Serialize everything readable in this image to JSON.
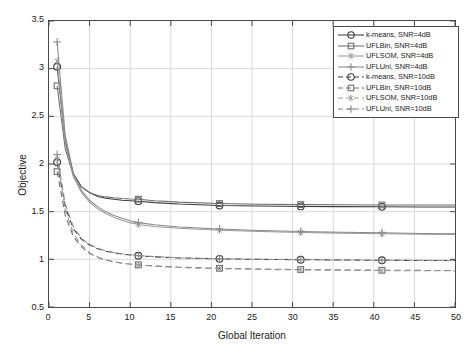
{
  "chart_data": {
    "type": "line",
    "title": "",
    "xlabel": "Global Iteration",
    "ylabel": "Objective",
    "xlim": [
      0,
      50
    ],
    "ylim": [
      0.5,
      3.5
    ],
    "xticks": [
      0,
      5,
      10,
      15,
      20,
      25,
      30,
      35,
      40,
      45,
      50
    ],
    "yticks": [
      0.5,
      1,
      1.5,
      2,
      2.5,
      3,
      3.5
    ],
    "grid": true,
    "legend_position": "top-right",
    "marker_x": [
      1,
      11,
      21,
      31,
      41
    ],
    "x": [
      1,
      2,
      3,
      4,
      5,
      6,
      7,
      8,
      9,
      10,
      11,
      13,
      16,
      21,
      26,
      31,
      36,
      41,
      46,
      50
    ],
    "series": [
      {
        "name": "k-means, SNR=4dB",
        "marker": "circle",
        "linestyle": "solid",
        "color": "#3c3c3c",
        "values": [
          3.02,
          2.24,
          1.9,
          1.76,
          1.7,
          1.66,
          1.64,
          1.63,
          1.62,
          1.615,
          1.61,
          1.595,
          1.58,
          1.565,
          1.56,
          1.555,
          1.553,
          1.551,
          1.55,
          1.55
        ]
      },
      {
        "name": "UFLBin, SNR=4dB",
        "marker": "square",
        "linestyle": "solid",
        "color": "#6e6e6e",
        "values": [
          2.82,
          2.16,
          1.88,
          1.76,
          1.7,
          1.67,
          1.655,
          1.645,
          1.638,
          1.633,
          1.63,
          1.615,
          1.6,
          1.585,
          1.578,
          1.574,
          1.572,
          1.57,
          1.569,
          1.569
        ]
      },
      {
        "name": "UFLSOM, SNR=4dB",
        "marker": "asterisk",
        "linestyle": "solid",
        "color": "#9a9a9a",
        "values": [
          3.08,
          2.22,
          1.87,
          1.7,
          1.6,
          1.53,
          1.48,
          1.44,
          1.41,
          1.385,
          1.365,
          1.345,
          1.325,
          1.305,
          1.292,
          1.282,
          1.275,
          1.268,
          1.263,
          1.26
        ]
      },
      {
        "name": "UFLUni, SNR=4dB",
        "marker": "plus",
        "linestyle": "solid",
        "color": "#8a8a8a",
        "values": [
          3.28,
          2.3,
          1.9,
          1.72,
          1.62,
          1.55,
          1.5,
          1.46,
          1.43,
          1.405,
          1.385,
          1.362,
          1.34,
          1.318,
          1.303,
          1.293,
          1.285,
          1.278,
          1.272,
          1.268
        ]
      },
      {
        "name": "k-means, SNR=10dB",
        "marker": "circle",
        "linestyle": "dashed",
        "color": "#3c3c3c",
        "values": [
          2.02,
          1.55,
          1.32,
          1.21,
          1.15,
          1.11,
          1.085,
          1.068,
          1.055,
          1.046,
          1.038,
          1.026,
          1.015,
          1.005,
          1.0,
          0.996,
          0.993,
          0.99,
          0.988,
          0.987
        ]
      },
      {
        "name": "UFLBin, SNR=10dB",
        "marker": "square",
        "linestyle": "dashed",
        "color": "#6e6e6e",
        "values": [
          1.92,
          1.46,
          1.24,
          1.13,
          1.06,
          1.018,
          0.992,
          0.974,
          0.96,
          0.95,
          0.942,
          0.93,
          0.918,
          0.906,
          0.898,
          0.893,
          0.889,
          0.886,
          0.884,
          0.883
        ]
      },
      {
        "name": "UFLSOM, SNR=10dB",
        "marker": "asterisk",
        "linestyle": "dashed",
        "color": "#9a9a9a",
        "values": [
          2.05,
          1.52,
          1.27,
          1.15,
          1.07,
          1.025,
          0.995,
          0.975,
          0.96,
          0.949,
          0.94,
          0.927,
          0.914,
          0.902,
          0.894,
          0.889,
          0.885,
          0.882,
          0.88,
          0.879
        ]
      },
      {
        "name": "UFLUni, SNR=10dB",
        "marker": "plus",
        "linestyle": "dashed",
        "color": "#8a8a8a",
        "values": [
          2.1,
          1.58,
          1.34,
          1.22,
          1.155,
          1.115,
          1.09,
          1.072,
          1.059,
          1.049,
          1.041,
          1.028,
          1.016,
          1.006,
          1.0,
          0.996,
          0.993,
          0.991,
          0.989,
          0.988
        ]
      }
    ]
  }
}
